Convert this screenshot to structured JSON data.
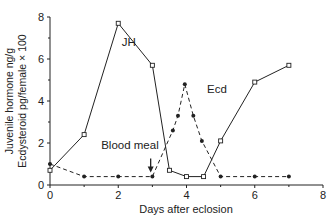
{
  "chart_data": {
    "type": "line",
    "title": "",
    "xlabel": "Days after eclosion",
    "ylabel_line1": "Juvenile hormone ng/g",
    "ylabel_line2": "Ecdysteroid pg/female × 100",
    "xlim": [
      0,
      8
    ],
    "ylim": [
      0,
      8
    ],
    "x_ticks": [
      "0",
      "2",
      "4",
      "6",
      "8"
    ],
    "y_ticks": [
      "0",
      "2",
      "4",
      "6",
      "8"
    ],
    "grid": false,
    "series": [
      {
        "name": "JH",
        "style": "solid",
        "marker": "open-square",
        "x": [
          0,
          1,
          2,
          3,
          3.5,
          4,
          4.5,
          5,
          6,
          7
        ],
        "values": [
          0.7,
          2.4,
          7.7,
          5.7,
          0.7,
          0.4,
          0.4,
          2.1,
          4.9,
          5.7
        ]
      },
      {
        "name": "Ecd",
        "style": "dashed",
        "marker": "filled-circle",
        "x": [
          0,
          1,
          2,
          3,
          3.6,
          3.75,
          3.95,
          4.2,
          4.45,
          5,
          6,
          7
        ],
        "values": [
          1.0,
          0.4,
          0.4,
          0.4,
          2.6,
          3.3,
          4.8,
          3.3,
          2.1,
          0.4,
          0.4,
          0.4
        ]
      }
    ],
    "annotations": [
      {
        "text": "JH",
        "x": 2.1,
        "y": 6.6
      },
      {
        "text": "Ecd",
        "x": 4.6,
        "y": 4.4
      },
      {
        "text": "Blood meal",
        "x": 1.5,
        "y": 1.7,
        "arrow_to": [
          2.95,
          0.6
        ]
      }
    ]
  }
}
